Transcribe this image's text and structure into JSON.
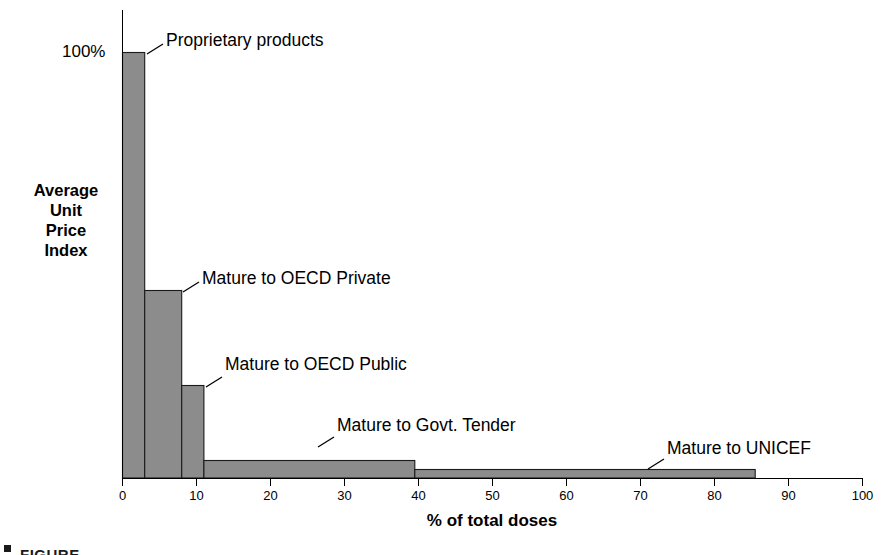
{
  "chart_data": {
    "type": "bar",
    "orientation": "vertical-variable-width",
    "title": "",
    "xlabel": "% of total doses",
    "ylabel": "Average Unit Price Index",
    "ylabel_lines": [
      "Average",
      "Unit",
      "Price",
      "Index"
    ],
    "xlim": [
      0,
      100
    ],
    "ylim": [
      0,
      100
    ],
    "grid": false,
    "legend": "none",
    "annotations_style": "leader-line callouts",
    "xticks": [
      0,
      10,
      20,
      30,
      40,
      50,
      60,
      70,
      80,
      90,
      100
    ],
    "xtick_labels": [
      "0",
      "10",
      "20",
      "30",
      "40",
      "50",
      "60",
      "70",
      "80",
      "90",
      "100"
    ],
    "yticks": [
      100
    ],
    "ytick_labels": [
      "100%"
    ],
    "categories": [
      "Proprietary products",
      "Mature to OECD Private",
      "Mature to OECD Public",
      "Mature to Govt. Tender",
      "Mature to UNICEF"
    ],
    "values": [
      100,
      44,
      22,
      4,
      2
    ],
    "segments": [
      {
        "label": "Proprietary products",
        "x_start": 0,
        "x_end": 3,
        "width_pct": 3,
        "price_index": 100
      },
      {
        "label": "Mature to OECD Private",
        "x_start": 3,
        "x_end": 8,
        "width_pct": 5,
        "price_index": 44
      },
      {
        "label": "Mature to OECD Public",
        "x_start": 8,
        "x_end": 11,
        "width_pct": 3,
        "price_index": 22
      },
      {
        "label": "Mature to Govt. Tender",
        "x_start": 11,
        "x_end": 39.5,
        "width_pct": 28.5,
        "price_index": 4
      },
      {
        "label": "Mature to UNICEF",
        "x_start": 39.5,
        "x_end": 85.5,
        "width_pct": 46,
        "price_index": 2
      }
    ],
    "colors": {
      "bar_fill": "#8c8c8c",
      "bar_stroke": "#1a1a1a",
      "axis": "#000000",
      "text": "#000000",
      "background": "#ffffff"
    }
  },
  "axis": {
    "y_label_top": "100%",
    "x_title": "% of total doses",
    "y_title_lines": [
      "Average",
      "Unit",
      "Price",
      "Index"
    ]
  },
  "callouts": [
    {
      "text": "Proprietary products"
    },
    {
      "text": "Mature to OECD Private"
    },
    {
      "text": "Mature to OECD Public"
    },
    {
      "text": "Mature to Govt. Tender"
    },
    {
      "text": "Mature to UNICEF"
    }
  ],
  "caption": {
    "fragment": "FIGURE"
  }
}
